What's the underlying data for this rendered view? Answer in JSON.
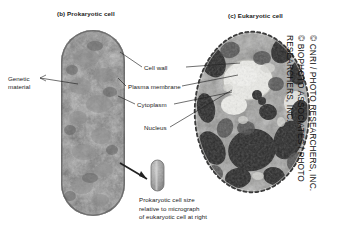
{
  "figure": {
    "panels": [
      {
        "id": "prokaryotic",
        "title": "(b)  Prokaryotic cell"
      },
      {
        "id": "eukaryotic",
        "title": "(c)  Eukaryotic cell"
      }
    ],
    "labels": {
      "genetic_material_line1": "Genetic",
      "genetic_material_line2": "material",
      "cell_wall": "Cell wall",
      "plasma_membrane": "Plasma membrane",
      "cytoplasm": "Cytoplasm",
      "nucleus": "Nucleus"
    },
    "scale_caption": {
      "line1": "Prokaryotic cell size",
      "line2": "relative to micrograph",
      "line3": "of eukaryotic cell at right"
    },
    "credit": {
      "line1": "© CNRI / PHOTO RESEARCHERS, INC.",
      "line2": "© BIOPHOTO ASSOCIATES / PHOTO",
      "line3": "RESEARCHERS, INC."
    },
    "colors": {
      "background": "#ffffff",
      "text": "#1a1a1a",
      "leader_line": "#222222",
      "prokaryote_fill": "#6e6e6e",
      "prokaryote_edge": "#4a4a4a",
      "eukaryote_fill": "#8a8a8a",
      "eukaryote_dark": "#2b2b2b",
      "eukaryote_light": "#e8e8e4",
      "scale_capsule": "#9a9a9a"
    }
  }
}
